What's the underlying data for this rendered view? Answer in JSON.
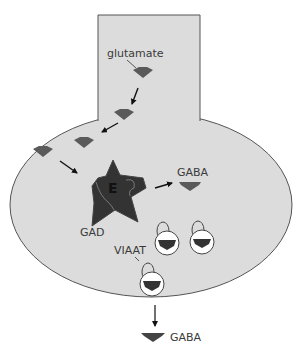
{
  "diagram": {
    "colors": {
      "cell_fill": "#dcdcdc",
      "cell_stroke": "#555555",
      "molecule": "#5a5a5a",
      "enzyme": "#333333",
      "vesicle_fill": "#ffffff",
      "arrow": "#111111"
    },
    "labels": {
      "glutamate": "glutamate",
      "enzyme_letter": "E",
      "enzyme_name": "GAD",
      "product": "GABA",
      "transporter": "VIAAT",
      "released": "GABA"
    },
    "nodes": [
      {
        "id": "glutamate-1",
        "type": "glutamate",
        "x": 143,
        "y": 73
      },
      {
        "id": "glutamate-2",
        "type": "glutamate",
        "x": 124,
        "y": 115
      },
      {
        "id": "glutamate-3",
        "type": "glutamate",
        "x": 84,
        "y": 143
      },
      {
        "id": "glutamate-4",
        "type": "glutamate",
        "x": 43,
        "y": 152
      },
      {
        "id": "gad-enzyme",
        "type": "enzyme",
        "x": 113,
        "y": 190
      },
      {
        "id": "gaba-internal",
        "type": "gaba",
        "x": 190,
        "y": 185
      },
      {
        "id": "vesicle-1",
        "type": "vesicle",
        "x": 166,
        "y": 243
      },
      {
        "id": "vesicle-2",
        "type": "vesicle",
        "x": 201,
        "y": 242
      },
      {
        "id": "vesicle-3",
        "type": "vesicle",
        "x": 152,
        "y": 285
      },
      {
        "id": "gaba-released",
        "type": "gaba",
        "x": 152,
        "y": 336
      }
    ],
    "edges": [
      {
        "from": "glutamate-1",
        "to": "glutamate-2"
      },
      {
        "from": "glutamate-2",
        "to": "glutamate-3"
      },
      {
        "from": "glutamate-4",
        "to": "gad-enzyme"
      },
      {
        "from": "gad-enzyme",
        "to": "gaba-internal"
      },
      {
        "from": "vesicle-3",
        "to": "gaba-released"
      }
    ]
  }
}
